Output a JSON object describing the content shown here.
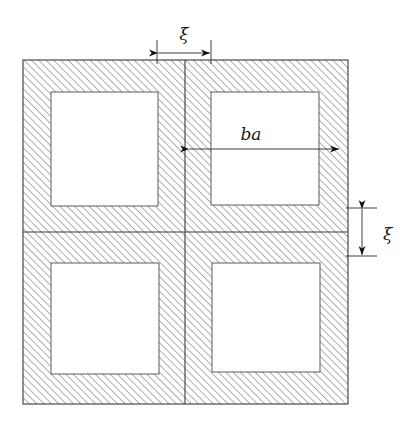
{
  "figure": {
    "background_color": "#ffffff",
    "line_color": "#3a3a3a",
    "hatch_color": "#777777",
    "hole_fill": "#ffffff",
    "labels": {
      "horizontal_gap": "ξ",
      "vertical_gap": "ξ",
      "hole_width": "ba"
    },
    "geometry": {
      "outer_square": {
        "x": 23,
        "y": 60,
        "width": 325,
        "height": 344
      },
      "divider_vertical_x": 185,
      "divider_horizontal_y": 232,
      "holes": [
        {
          "name": "top-left-hole",
          "x": 51,
          "y": 92,
          "width": 107,
          "height": 114
        },
        {
          "name": "top-right-hole",
          "x": 211,
          "y": 92,
          "width": 108,
          "height": 113
        },
        {
          "name": "bottom-left-hole",
          "x": 51,
          "y": 263,
          "width": 108,
          "height": 111
        },
        {
          "name": "bottom-right-hole",
          "x": 212,
          "y": 263,
          "width": 108,
          "height": 109
        }
      ]
    },
    "dimensions": [
      {
        "name": "xi-top",
        "label": "ξ",
        "orientation": "horizontal",
        "from": 157,
        "to": 211,
        "axis_position": 53,
        "label_x": 184,
        "label_y": 40
      },
      {
        "name": "ba-horizontal",
        "label": "ba",
        "orientation": "horizontal",
        "from": 188,
        "to": 340,
        "axis_position": 149,
        "label_x": 251,
        "label_y": 139
      },
      {
        "name": "xi-right",
        "label": "ξ",
        "orientation": "vertical",
        "from": 208,
        "to": 256,
        "axis_position": 362,
        "label_x": 383,
        "label_y": 240
      }
    ]
  }
}
